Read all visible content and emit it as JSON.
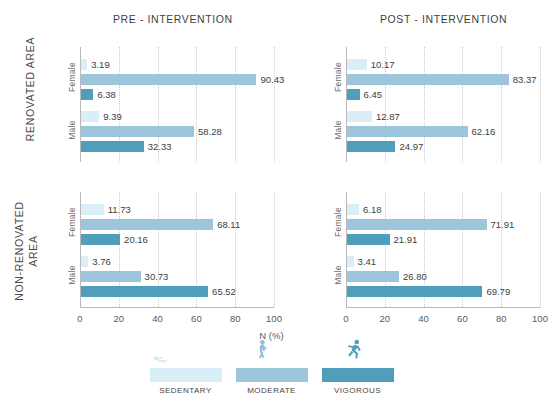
{
  "figure": {
    "axis_caption": "N (%)",
    "column_titles": [
      "PRE - INTERVENTION",
      "POST - INTERVENTION"
    ],
    "row_titles": [
      "RENOVATED AREA",
      "NON-RENOVATED AREA"
    ],
    "gender_labels": [
      "Female",
      "Male"
    ],
    "xticks": [
      "0",
      "20",
      "40",
      "60",
      "80",
      "100"
    ]
  },
  "legend": {
    "position": "bottom-center",
    "items": [
      {
        "label": "SEDENTARY",
        "color": "#d9eef7",
        "icon": "sedentary-person-icon"
      },
      {
        "label": "MODERATE",
        "color": "#9dc6dd",
        "icon": "walking-person-icon"
      },
      {
        "label": "VIGOROUS",
        "color": "#4f9fbb",
        "icon": "running-person-icon"
      }
    ]
  },
  "colors": {
    "sedentary": "#d9eef7",
    "moderate": "#9dc6dd",
    "vigorous": "#4f9fbb",
    "axis": "#b9b9b9",
    "grid": "#c9c9c9",
    "text": "#3d3d3d"
  },
  "chart_data": {
    "type": "bar",
    "orientation": "horizontal",
    "xlabel": "N (%)",
    "ylabel": "",
    "xlim": [
      0,
      100
    ],
    "xticks": [
      0,
      20,
      40,
      60,
      80,
      100
    ],
    "grid": "vertical-dotted",
    "legend": [
      "SEDENTARY",
      "MODERATE",
      "VIGOROUS"
    ],
    "panels": [
      {
        "row": "RENOVATED AREA",
        "column": "PRE - INTERVENTION",
        "groups": [
          {
            "name": "Female",
            "series": [
              {
                "name": "SEDENTARY",
                "value": 3.19
              },
              {
                "name": "MODERATE",
                "value": 90.43
              },
              {
                "name": "VIGOROUS",
                "value": 6.38
              }
            ]
          },
          {
            "name": "Male",
            "series": [
              {
                "name": "SEDENTARY",
                "value": 9.39
              },
              {
                "name": "MODERATE",
                "value": 58.28
              },
              {
                "name": "VIGOROUS",
                "value": 32.33
              }
            ]
          }
        ]
      },
      {
        "row": "RENOVATED AREA",
        "column": "POST - INTERVENTION",
        "groups": [
          {
            "name": "Female",
            "series": [
              {
                "name": "SEDENTARY",
                "value": 10.17
              },
              {
                "name": "MODERATE",
                "value": 83.37
              },
              {
                "name": "VIGOROUS",
                "value": 6.45
              }
            ]
          },
          {
            "name": "Male",
            "series": [
              {
                "name": "SEDENTARY",
                "value": 12.87
              },
              {
                "name": "MODERATE",
                "value": 62.16
              },
              {
                "name": "VIGOROUS",
                "value": 24.97
              }
            ]
          }
        ]
      },
      {
        "row": "NON-RENOVATED AREA",
        "column": "PRE - INTERVENTION",
        "groups": [
          {
            "name": "Female",
            "series": [
              {
                "name": "SEDENTARY",
                "value": 11.73
              },
              {
                "name": "MODERATE",
                "value": 68.11
              },
              {
                "name": "VIGOROUS",
                "value": 20.16
              }
            ]
          },
          {
            "name": "Male",
            "series": [
              {
                "name": "SEDENTARY",
                "value": 3.76
              },
              {
                "name": "MODERATE",
                "value": 30.73
              },
              {
                "name": "VIGOROUS",
                "value": 65.52
              }
            ]
          }
        ]
      },
      {
        "row": "NON-RENOVATED AREA",
        "column": "POST - INTERVENTION",
        "groups": [
          {
            "name": "Female",
            "series": [
              {
                "name": "SEDENTARY",
                "value": 6.18
              },
              {
                "name": "MODERATE",
                "value": 71.91
              },
              {
                "name": "VIGOROUS",
                "value": 21.91
              }
            ]
          },
          {
            "name": "Male",
            "series": [
              {
                "name": "SEDENTARY",
                "value": 3.41
              },
              {
                "name": "MODERATE",
                "value": 26.8
              },
              {
                "name": "VIGOROUS",
                "value": 69.79
              }
            ]
          }
        ]
      }
    ]
  }
}
